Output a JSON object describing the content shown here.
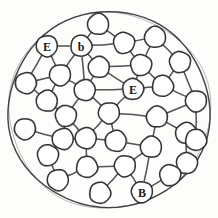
{
  "diagram": {
    "style": "hand-drawn pencil sketch, black ink on white paper",
    "colors": {
      "background": "#fdfdfc",
      "stroke": "#2b2b2b",
      "boundary_stroke": "#3a3a3a",
      "node_fill": "#ffffff",
      "edge_stroke": "#4a4a4a",
      "label_text": "#1c1c1c"
    },
    "boundary": {
      "shape": "circle",
      "label": "outer-boundary-circle",
      "cx": 109,
      "cy": 110,
      "rx": 101,
      "ry": 98
    },
    "node_radius": 10.5,
    "labels_present": [
      "E",
      "b",
      "E",
      "B"
    ],
    "node_count": 33,
    "edge_count": 52,
    "nodes": [
      {
        "id": "n1",
        "cx": 47,
        "cy": 46,
        "label": "E"
      },
      {
        "id": "n2",
        "cx": 81,
        "cy": 46,
        "label": "b"
      },
      {
        "id": "n3",
        "cx": 98,
        "cy": 24,
        "label": ""
      },
      {
        "id": "n4",
        "cx": 124,
        "cy": 43,
        "label": ""
      },
      {
        "id": "n5",
        "cx": 155,
        "cy": 37,
        "label": ""
      },
      {
        "id": "n6",
        "cx": 60,
        "cy": 75,
        "label": ""
      },
      {
        "id": "n7",
        "cx": 99,
        "cy": 67,
        "label": ""
      },
      {
        "id": "n8",
        "cx": 141,
        "cy": 65,
        "label": ""
      },
      {
        "id": "n9",
        "cx": 180,
        "cy": 62,
        "label": ""
      },
      {
        "id": "n10",
        "cx": 26,
        "cy": 83,
        "label": ""
      },
      {
        "id": "n11",
        "cx": 133,
        "cy": 89,
        "label": "E"
      },
      {
        "id": "n12",
        "cx": 163,
        "cy": 86,
        "label": ""
      },
      {
        "id": "n13",
        "cx": 85,
        "cy": 90,
        "label": ""
      },
      {
        "id": "n14",
        "cx": 47,
        "cy": 101,
        "label": ""
      },
      {
        "id": "n15",
        "cx": 196,
        "cy": 101,
        "label": ""
      },
      {
        "id": "n16",
        "cx": 66,
        "cy": 116,
        "label": ""
      },
      {
        "id": "n17",
        "cx": 109,
        "cy": 113,
        "label": ""
      },
      {
        "id": "n18",
        "cx": 157,
        "cy": 117,
        "label": ""
      },
      {
        "id": "n19",
        "cx": 25,
        "cy": 129,
        "label": ""
      },
      {
        "id": "n20",
        "cx": 186,
        "cy": 133,
        "label": ""
      },
      {
        "id": "n21",
        "cx": 86,
        "cy": 138,
        "label": ""
      },
      {
        "id": "n22",
        "cx": 116,
        "cy": 141,
        "label": ""
      },
      {
        "id": "n23",
        "cx": 151,
        "cy": 147,
        "label": ""
      },
      {
        "id": "n24",
        "cx": 48,
        "cy": 155,
        "label": ""
      },
      {
        "id": "n25",
        "cx": 187,
        "cy": 163,
        "label": ""
      },
      {
        "id": "n26",
        "cx": 87,
        "cy": 167,
        "label": ""
      },
      {
        "id": "n27",
        "cx": 125,
        "cy": 166,
        "label": ""
      },
      {
        "id": "n28",
        "cx": 58,
        "cy": 180,
        "label": ""
      },
      {
        "id": "n29",
        "cx": 100,
        "cy": 193,
        "label": ""
      },
      {
        "id": "n30",
        "cx": 142,
        "cy": 192,
        "label": "B"
      },
      {
        "id": "n31",
        "cx": 170,
        "cy": 175,
        "label": ""
      },
      {
        "id": "n32",
        "cx": 196,
        "cy": 140,
        "label": ""
      },
      {
        "id": "n33",
        "cx": 63,
        "cy": 139,
        "label": ""
      }
    ],
    "edges": [
      {
        "from": "n1",
        "to": "n2"
      },
      {
        "from": "n1",
        "to": "n10"
      },
      {
        "from": "n1",
        "to": "n6"
      },
      {
        "from": "n2",
        "to": "n3"
      },
      {
        "from": "n2",
        "to": "n4"
      },
      {
        "from": "n2",
        "to": "n6"
      },
      {
        "from": "n2",
        "to": "n7"
      },
      {
        "from": "n2",
        "to": "n13"
      },
      {
        "from": "n3",
        "to": "n4"
      },
      {
        "from": "n4",
        "to": "n5"
      },
      {
        "from": "n4",
        "to": "n8"
      },
      {
        "from": "n5",
        "to": "n8"
      },
      {
        "from": "n5",
        "to": "n9"
      },
      {
        "from": "n6",
        "to": "n10"
      },
      {
        "from": "n6",
        "to": "n14"
      },
      {
        "from": "n6",
        "to": "n13"
      },
      {
        "from": "n7",
        "to": "n8"
      },
      {
        "from": "n7",
        "to": "n13"
      },
      {
        "from": "n7",
        "to": "n11"
      },
      {
        "from": "n8",
        "to": "n11"
      },
      {
        "from": "n8",
        "to": "n12"
      },
      {
        "from": "n9",
        "to": "n12"
      },
      {
        "from": "n9",
        "to": "n15"
      },
      {
        "from": "n10",
        "to": "n14"
      },
      {
        "from": "n11",
        "to": "n12"
      },
      {
        "from": "n11",
        "to": "n17"
      },
      {
        "from": "n11",
        "to": "n13"
      },
      {
        "from": "n12",
        "to": "n15"
      },
      {
        "from": "n13",
        "to": "n16"
      },
      {
        "from": "n13",
        "to": "n17"
      },
      {
        "from": "n14",
        "to": "n16"
      },
      {
        "from": "n15",
        "to": "n18"
      },
      {
        "from": "n15",
        "to": "n32"
      },
      {
        "from": "n16",
        "to": "n33"
      },
      {
        "from": "n16",
        "to": "n21"
      },
      {
        "from": "n17",
        "to": "n21"
      },
      {
        "from": "n17",
        "to": "n22"
      },
      {
        "from": "n17",
        "to": "n18"
      },
      {
        "from": "n18",
        "to": "n20"
      },
      {
        "from": "n18",
        "to": "n23"
      },
      {
        "from": "n19",
        "to": "n33"
      },
      {
        "from": "n20",
        "to": "n32"
      },
      {
        "from": "n20",
        "to": "n25"
      },
      {
        "from": "n21",
        "to": "n22"
      },
      {
        "from": "n21",
        "to": "n26"
      },
      {
        "from": "n22",
        "to": "n23"
      },
      {
        "from": "n23",
        "to": "n27"
      },
      {
        "from": "n23",
        "to": "n30"
      },
      {
        "from": "n24",
        "to": "n33"
      },
      {
        "from": "n24",
        "to": "n28"
      },
      {
        "from": "n25",
        "to": "n31"
      },
      {
        "from": "n26",
        "to": "n27"
      },
      {
        "from": "n26",
        "to": "n28"
      },
      {
        "from": "n27",
        "to": "n29"
      },
      {
        "from": "n27",
        "to": "n30"
      },
      {
        "from": "n30",
        "to": "n31"
      },
      {
        "from": "n33",
        "to": "n21"
      }
    ]
  }
}
